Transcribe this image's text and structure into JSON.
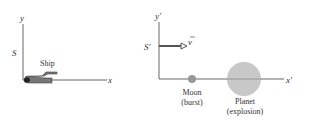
{
  "frame_s": {
    "frame_label": "S",
    "y_label": "y",
    "x_label": "x",
    "object_label": "Ship"
  },
  "frame_s_prime": {
    "frame_label": "S′",
    "y_label": "y′",
    "x_label": "x′",
    "velocity_label": "v"
  },
  "events": [
    {
      "name": "Moon",
      "note": "(burst)"
    },
    {
      "name": "Planet",
      "note": "(explosion)"
    }
  ],
  "colors": {
    "axis": "#555555",
    "ship": "#666666",
    "moon": "#999999",
    "planet": "#c8c8c8"
  }
}
